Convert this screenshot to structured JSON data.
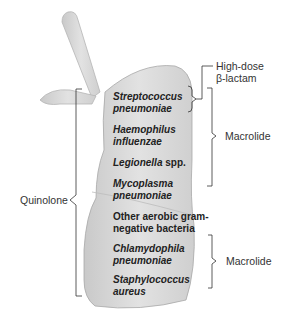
{
  "diagram": {
    "type": "anatomical-annotation",
    "pathogens": [
      {
        "line1": "Streptococcus",
        "line2": "pneumoniae",
        "italic": true
      },
      {
        "line1": "Haemophilus",
        "line2": "influenzae",
        "italic": true
      },
      {
        "line1": "Legionella",
        "line2": " spp.",
        "italic": "partial"
      },
      {
        "line1": "Mycoplasma",
        "line2": "pneumoniae",
        "italic": true
      },
      {
        "line1": "Other aerobic gram-",
        "line2": "negative bacteria",
        "italic": false
      },
      {
        "line1": "Chlamydophila",
        "line2": "pneumoniae",
        "italic": true
      },
      {
        "line1": "Staphylococcus",
        "line2": "aureus",
        "italic": true
      }
    ],
    "treatments": {
      "high_dose_line1": "High-dose",
      "high_dose_line2": "β-lactam",
      "macrolide_top": "Macrolide",
      "macrolide_bottom": "Macrolide",
      "quinolone": "Quinolone"
    },
    "colors": {
      "lung_fill": "#dcdcdc",
      "lung_stroke": "#a8a8a8",
      "bracket": "#333333",
      "text": "#222222"
    }
  }
}
